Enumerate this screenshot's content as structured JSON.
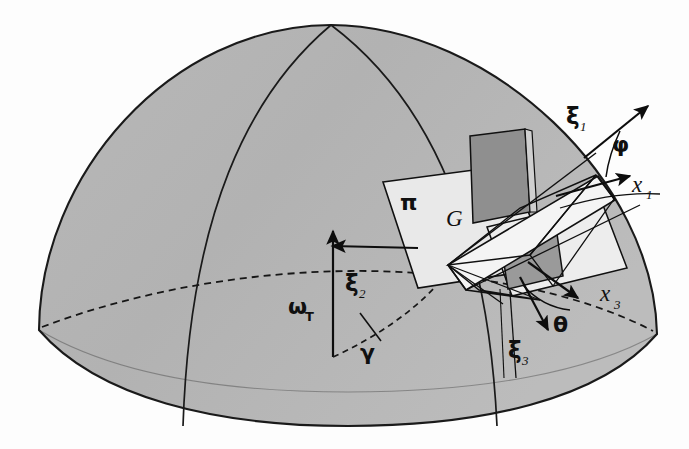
{
  "figure": {
    "kind": "3d-geometry-diagram",
    "background_color": "#fdfdfd"
  },
  "colors": {
    "dome_fill": "#b3b3b3",
    "dome_fill_light": "#bdbdbd",
    "dome_outline": "#1a1a1a",
    "plane_pi_fill": "#e9e9e9",
    "blade_fill_dark": "#8f8f8f",
    "blade_fill_mid": "#a0a0a0",
    "band_fill_light": "#f2f2f2",
    "line_color": "#101010",
    "arrow_color": "#0d0d0d",
    "dashed_color": "#161616"
  },
  "labels": {
    "xi1": {
      "text": "ξ",
      "sub": "1",
      "x": 569,
      "y": 118
    },
    "xi2": {
      "text": "ξ",
      "sub": "2",
      "x": 349,
      "y": 285
    },
    "xi3": {
      "text": "ξ",
      "sub": "3",
      "x": 512,
      "y": 352
    },
    "x1": {
      "text": "x",
      "sub": "1",
      "x": 636,
      "y": 186
    },
    "x3": {
      "text": "x",
      "sub": "3",
      "x": 604,
      "y": 295
    },
    "phi": {
      "text": "φ",
      "x": 617,
      "y": 147
    },
    "theta": {
      "text": "θ",
      "x": 559,
      "y": 325
    },
    "gamma": {
      "text": "γ",
      "x": 364,
      "y": 353
    },
    "omegaT": {
      "text": "ω",
      "sub": "T",
      "x": 293,
      "y": 307
    },
    "pi": {
      "text": "π",
      "x": 406,
      "y": 203
    },
    "G": {
      "text": "G",
      "x": 452,
      "y": 218
    }
  },
  "geometry": {
    "dome": {
      "apex": [
        331,
        25
      ],
      "left_rim": [
        39,
        330
      ],
      "right_rim": [
        657,
        334
      ],
      "rim_bottom_y": 426
    },
    "meridians": 2,
    "dashed_parallel": true,
    "axes": {
      "xi1_arrow_tip": [
        652,
        103
      ],
      "x1_arrow_tip": [
        636,
        172
      ],
      "xi2_arrow_tip": [
        334,
        245
      ],
      "xi3_arrow_tip": [
        551,
        330
      ],
      "x3_arrow_tip": [
        581,
        292
      ],
      "omegaT_arrow_tip": [
        333,
        228
      ]
    }
  }
}
